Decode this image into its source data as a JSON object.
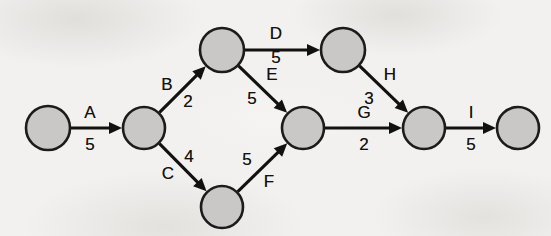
{
  "diagram": {
    "type": "directed-graph",
    "background_color": "#f2f1ef",
    "node_fill_color": "#c9c8c6",
    "node_stroke_color": "#1b1b1b",
    "edge_color": "#111111",
    "label_color": "#121212",
    "nodes": [
      {
        "id": "n1",
        "cx": 48,
        "cy": 128,
        "r": 22
      },
      {
        "id": "n2",
        "cx": 144,
        "cy": 128,
        "r": 21
      },
      {
        "id": "n3",
        "cx": 222,
        "cy": 50,
        "r": 22
      },
      {
        "id": "n4",
        "cx": 343,
        "cy": 50,
        "r": 22
      },
      {
        "id": "n5",
        "cx": 303,
        "cy": 128,
        "r": 21
      },
      {
        "id": "n6",
        "cx": 424,
        "cy": 128,
        "r": 21
      },
      {
        "id": "n7",
        "cx": 518,
        "cy": 128,
        "r": 21
      },
      {
        "id": "n8",
        "cx": 222,
        "cy": 207,
        "r": 21
      }
    ],
    "edges": [
      {
        "id": "A",
        "name": "A",
        "duration": "5",
        "from": "n1",
        "to": "n2",
        "name_x": 90,
        "name_y": 112,
        "duration_x": 90,
        "duration_y": 144
      },
      {
        "id": "B",
        "name": "B",
        "duration": "2",
        "from": "n2",
        "to": "n3",
        "name_x": 167,
        "name_y": 84,
        "duration_x": 188,
        "duration_y": 101
      },
      {
        "id": "C",
        "name": "C",
        "duration": "4",
        "from": "n2",
        "to": "n8",
        "name_x": 168,
        "name_y": 173,
        "duration_x": 189,
        "duration_y": 156
      },
      {
        "id": "D",
        "name": "D",
        "duration": "5",
        "from": "n3",
        "to": "n4",
        "name_x": 276,
        "name_y": 33,
        "duration_x": 276,
        "duration_y": 57
      },
      {
        "id": "E",
        "name": "E",
        "duration": "5",
        "from": "n3",
        "to": "n5",
        "name_x": 272,
        "name_y": 74,
        "duration_x": 252,
        "duration_y": 98
      },
      {
        "id": "F",
        "name": "F",
        "duration": "5",
        "from": "n8",
        "to": "n5",
        "name_x": 269,
        "name_y": 181,
        "duration_x": 247,
        "duration_y": 159
      },
      {
        "id": "G",
        "name": "G",
        "duration": "2",
        "from": "n5",
        "to": "n6",
        "name_x": 364,
        "name_y": 112,
        "duration_x": 364,
        "duration_y": 144
      },
      {
        "id": "H",
        "name": "H",
        "duration": "3",
        "from": "n4",
        "to": "n6",
        "name_x": 390,
        "name_y": 74,
        "duration_x": 369,
        "duration_y": 98
      },
      {
        "id": "I",
        "name": "I",
        "duration": "5",
        "from": "n6",
        "to": "n7",
        "name_x": 471,
        "name_y": 112,
        "duration_x": 471,
        "duration_y": 144
      }
    ]
  }
}
